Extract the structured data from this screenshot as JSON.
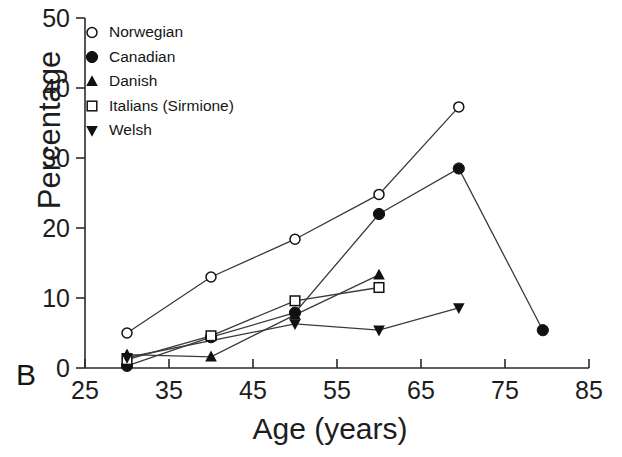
{
  "figure": {
    "panel_letter": "B"
  },
  "chart_data": {
    "type": "line",
    "title": "",
    "subtitle": "",
    "xlabel": "Age (years)",
    "ylabel": "Percentage",
    "xlim": [
      25,
      85
    ],
    "ylim": [
      0,
      50
    ],
    "xticks": [
      25,
      35,
      45,
      55,
      65,
      75,
      85
    ],
    "yticks": [
      0,
      10,
      20,
      30,
      40,
      50
    ],
    "xtick_labels": [
      "25",
      "35",
      "45",
      "55",
      "65",
      "75",
      "85"
    ],
    "ytick_labels": [
      "0",
      "10",
      "20",
      "30",
      "40",
      "50"
    ],
    "grid": false,
    "legend_position": "top-left-inside",
    "series": [
      {
        "name": "Norwegian",
        "marker": "open-circle",
        "x": [
          30,
          40,
          50,
          60,
          69.5
        ],
        "values": [
          5.0,
          13.0,
          18.4,
          24.8,
          37.3
        ]
      },
      {
        "name": "Canadian",
        "marker": "filled-circle",
        "x": [
          30,
          40,
          50,
          60,
          69.5,
          79.5
        ],
        "values": [
          0.3,
          4.4,
          7.9,
          22.0,
          28.5,
          5.4
        ]
      },
      {
        "name": "Danish",
        "marker": "filled-up-triangle",
        "x": [
          30,
          40,
          50,
          60
        ],
        "values": [
          1.9,
          1.6,
          7.6,
          13.3
        ]
      },
      {
        "name": "Italians (Sirmione)",
        "marker": "open-square",
        "x": [
          30,
          40,
          50,
          60
        ],
        "values": [
          1.2,
          4.6,
          9.6,
          11.5
        ]
      },
      {
        "name": "Welsh",
        "marker": "filled-down-triangle",
        "x": [
          30,
          50,
          60,
          69.5
        ],
        "values": [
          1.5,
          6.3,
          5.4,
          8.6
        ]
      }
    ],
    "legend": [
      {
        "label": "Norwegian",
        "marker": "open-circle"
      },
      {
        "label": "Canadian",
        "marker": "filled-circle"
      },
      {
        "label": "Danish",
        "marker": "filled-up-triangle"
      },
      {
        "label": "Italians (Sirmione)",
        "marker": "open-square"
      },
      {
        "label": "Welsh",
        "marker": "filled-down-triangle"
      }
    ],
    "colors": {
      "line": "#3a3a3a",
      "marker_fill": "#111111",
      "marker_open_fill": "#ffffff",
      "axis": "#2b2b2b",
      "text": "#1d1d1d"
    }
  }
}
